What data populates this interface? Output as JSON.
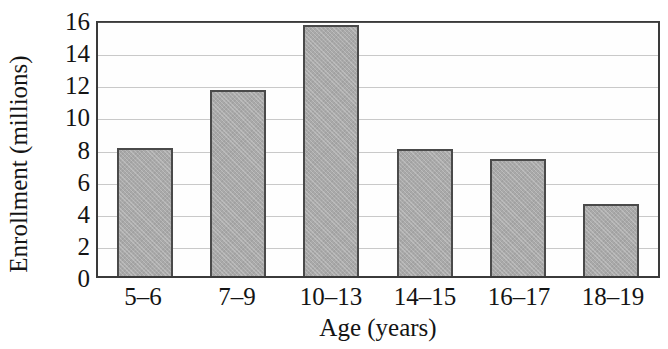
{
  "chart_data": {
    "type": "bar",
    "title": "",
    "xlabel": "Age (years)",
    "ylabel": "Enrollment (millions)",
    "categories": [
      "5–6",
      "7–9",
      "10–13",
      "14–15",
      "16–17",
      "18–19"
    ],
    "values": [
      8.0,
      11.6,
      15.6,
      7.9,
      7.3,
      4.5
    ],
    "ylim": [
      0,
      16
    ],
    "ytick_labels": [
      "0",
      "2",
      "4",
      "6",
      "8",
      "10",
      "12",
      "14",
      "16"
    ],
    "ytick_values": [
      0,
      2,
      4,
      6,
      8,
      10,
      12,
      14,
      16
    ],
    "grid": "horizontal",
    "legend": "none",
    "series": [
      {
        "name": "Enrollment",
        "values": [
          8.0,
          11.6,
          15.6,
          7.9,
          7.3,
          4.5
        ]
      }
    ],
    "colors": {
      "bar_fill": "#a9a9a9",
      "bar_edge": "#4a4a4a",
      "gridline": "#c9c9c9",
      "frame": "#3a3a3a",
      "text": "#141414",
      "background": "#ffffff"
    }
  }
}
